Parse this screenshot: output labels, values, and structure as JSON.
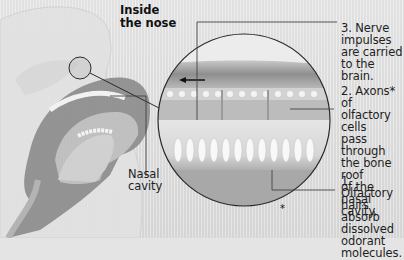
{
  "title": "Inside\n  the nose",
  "labels": {
    "nerve": "3. Nerve\nimpulses\nare carried\nto the brain.",
    "axons": "2. Axons* of\nolfactory cells\npass through\nthe bone roof\nof the nasal\ncavity.",
    "hairs": "1. Olfactory\nhairs absorb\ndissolved\nodorant\nmolecules.",
    "nasal_cavity": "Nasal\ncavity"
  },
  "footnote_marker": "*",
  "colors": {
    "background": "#e4e4e4",
    "head_dark": "#8a8a8a",
    "circle_outline": "#2a2a2a",
    "text": "#1e1e1e"
  }
}
